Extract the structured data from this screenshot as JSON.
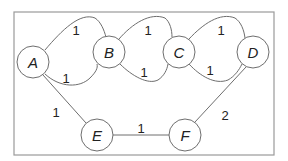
{
  "graph": {
    "nodes": [
      {
        "id": "A",
        "label": "A",
        "x": 33,
        "y": 62
      },
      {
        "id": "B",
        "label": "B",
        "x": 109,
        "y": 52
      },
      {
        "id": "C",
        "label": "C",
        "x": 179,
        "y": 52
      },
      {
        "id": "D",
        "label": "D",
        "x": 253,
        "y": 52
      },
      {
        "id": "E",
        "label": "E",
        "x": 97,
        "y": 135
      },
      {
        "id": "F",
        "label": "F",
        "x": 185,
        "y": 135
      }
    ],
    "edges": [
      {
        "from": "A",
        "to": "B",
        "route": "upper",
        "weight": "1"
      },
      {
        "from": "A",
        "to": "B",
        "route": "lower",
        "weight": "1"
      },
      {
        "from": "B",
        "to": "C",
        "route": "upper",
        "weight": "1"
      },
      {
        "from": "B",
        "to": "C",
        "route": "lower",
        "weight": "1"
      },
      {
        "from": "C",
        "to": "D",
        "route": "upper",
        "weight": "1"
      },
      {
        "from": "C",
        "to": "D",
        "route": "lower",
        "weight": "1"
      },
      {
        "from": "A",
        "to": "E",
        "route": "straight",
        "weight": "1"
      },
      {
        "from": "E",
        "to": "F",
        "route": "straight",
        "weight": "1"
      },
      {
        "from": "F",
        "to": "D",
        "route": "straight",
        "weight": "2"
      }
    ]
  }
}
